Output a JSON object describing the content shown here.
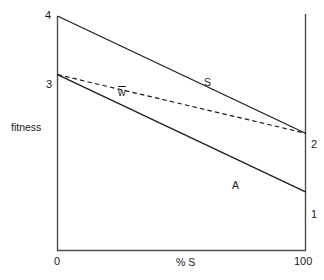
{
  "chart_data": {
    "type": "line",
    "title": "",
    "xlabel": "% S",
    "ylabel": "fitness",
    "xlim": [
      0,
      100
    ],
    "ylim": [
      0,
      4
    ],
    "grid": false,
    "legend": "inline-annotations",
    "x_ticks": [
      "0",
      "100"
    ],
    "x_tick_values": [
      0,
      100
    ],
    "y_ticks_left": [
      "4",
      "3"
    ],
    "y_tick_values_left": [
      4,
      3
    ],
    "y_ticks_right": [
      "2",
      "1"
    ],
    "y_tick_values_right": [
      2,
      1
    ],
    "series": [
      {
        "name": "S",
        "style": "solid",
        "color": "#1a1a1a",
        "x": [
          0,
          100
        ],
        "values": [
          4,
          2
        ]
      },
      {
        "name": "A",
        "style": "solid",
        "color": "#1a1a1a",
        "x": [
          0,
          100
        ],
        "values": [
          3,
          1
        ]
      },
      {
        "name": "w̄",
        "style": "dashed",
        "color": "#1a1a1a",
        "x": [
          0,
          100
        ],
        "values": [
          3,
          2
        ]
      }
    ],
    "annotations": [
      {
        "text": "S",
        "x": 61,
        "y": 2.95
      },
      {
        "text": "A",
        "x": 72,
        "y": 1.58
      },
      {
        "text": "w",
        "overbar": true,
        "x": 26,
        "y": 2.83
      }
    ]
  },
  "axes": {
    "y_label": "fitness",
    "x_label": "% S",
    "x_min_label": "0",
    "x_max_label": "100",
    "y_top_left_label": "4",
    "y_mid_left_label": "3",
    "y_upper_right_label": "2",
    "y_lower_right_label": "1"
  },
  "series_labels": {
    "s": "S",
    "a": "A",
    "wbar": "w"
  },
  "colors": {
    "line": "#1a1a1a",
    "axis": "#4d4d4d",
    "text": "#1a1a1a",
    "background": "#ffffff"
  }
}
